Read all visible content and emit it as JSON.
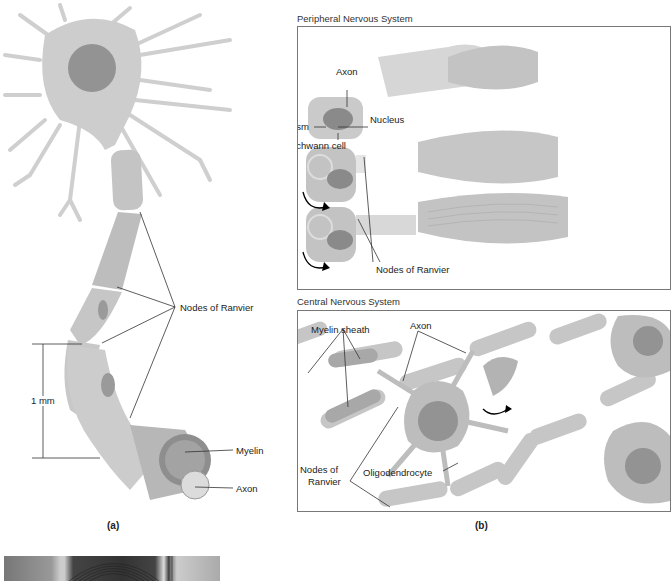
{
  "figure": {
    "panel_a": {
      "caption": "(a)",
      "labels": {
        "nodes_of_ranvier": "Nodes of Ranvier",
        "scale": "1 mm",
        "myelin": "Myelin",
        "axon": "Axon"
      }
    },
    "panel_b": {
      "caption": "(b)",
      "pns": {
        "title": "Peripheral Nervous System",
        "labels": {
          "axon": "Axon",
          "cytoplasm": "Cytoplasm",
          "nucleus": "Nucleus",
          "schwann_cell": "Schwann cell",
          "nodes_of_ranvier": "Nodes of Ranvier"
        }
      },
      "cns": {
        "title": "Central Nervous System",
        "labels": {
          "myelin_sheath": "Myelin sheath",
          "axon": "Axon",
          "nodes_of_ranvier_1": "Nodes of",
          "nodes_of_ranvier_2": "Ranvier",
          "oligodendrocyte": "Oligodendrocyte"
        }
      }
    },
    "colors": {
      "cell_fill": "#c9c9c9",
      "nucleus": "#8e8e8e",
      "line": "#333333",
      "frame": "#777777"
    }
  }
}
